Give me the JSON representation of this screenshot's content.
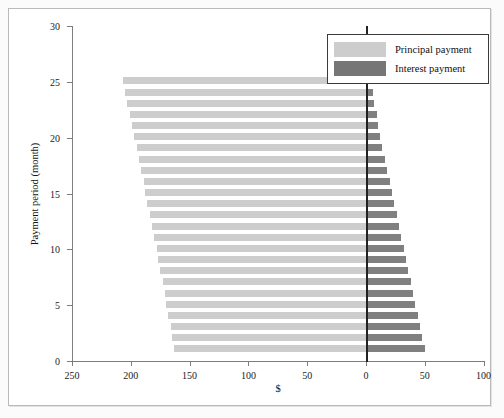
{
  "chart_data": {
    "type": "bar",
    "title": "",
    "subtitle": "",
    "xlabel": "$",
    "ylabel": "Payment period (month)",
    "orientation": "horizontal-diverging",
    "grid": false,
    "legend_position": "top-right",
    "xlim": [
      -250,
      100
    ],
    "ylim": [
      0,
      30
    ],
    "xticks": [
      250,
      200,
      150,
      100,
      50,
      0,
      50,
      100
    ],
    "xtick_values": [
      -250,
      -200,
      -150,
      -100,
      -50,
      0,
      50,
      100
    ],
    "yticks": [
      0,
      5,
      10,
      15,
      20,
      25,
      30
    ],
    "categories": [
      1,
      2,
      3,
      4,
      5,
      6,
      7,
      8,
      9,
      10,
      11,
      12,
      13,
      14,
      15,
      16,
      17,
      18,
      19,
      20,
      21,
      22,
      23,
      24,
      25
    ],
    "series": [
      {
        "name": "Principal payment",
        "color": "#cdcdcd",
        "direction": "left",
        "values": [
          163,
          165,
          166,
          168,
          170,
          171,
          173,
          175,
          177,
          178,
          180,
          182,
          184,
          186,
          188,
          189,
          191,
          193,
          195,
          197,
          199,
          201,
          203,
          205,
          207
        ]
      },
      {
        "name": "Interest payment",
        "color": "#808080",
        "direction": "right",
        "values": [
          50,
          48,
          46,
          44,
          42,
          40,
          38,
          36,
          34,
          32,
          30,
          28,
          26,
          24,
          22,
          20,
          18,
          16,
          14,
          12,
          10,
          9,
          7,
          6,
          5
        ]
      }
    ]
  },
  "legend": {
    "items": [
      {
        "label": "Principal payment",
        "color": "#cdcdcd"
      },
      {
        "label": "Interest payment",
        "color": "#767676"
      }
    ]
  },
  "axes": {
    "x_label": "$",
    "y_label": "Payment period (month)"
  }
}
